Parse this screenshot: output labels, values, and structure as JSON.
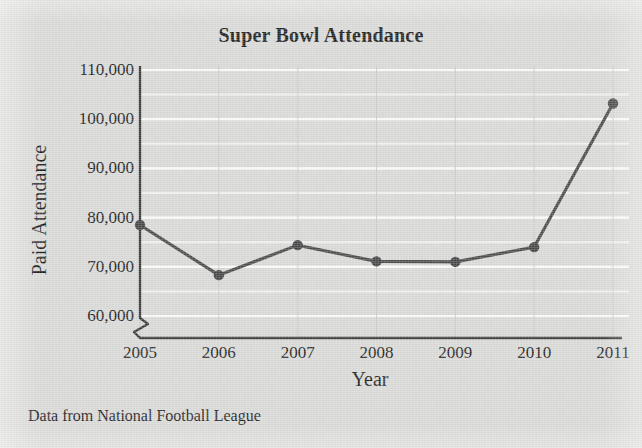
{
  "chart_data": {
    "type": "line",
    "title": "Super Bowl Attendance",
    "xlabel": "Year",
    "ylabel": "Paid Attendance",
    "categories": [
      "2005",
      "2006",
      "2007",
      "2008",
      "2009",
      "2010",
      "2011"
    ],
    "x": [
      2005,
      2006,
      2007,
      2008,
      2009,
      2010,
      2011
    ],
    "values": [
      78500,
      68300,
      74400,
      71100,
      71000,
      74000,
      103200
    ],
    "series": [
      {
        "name": "Paid Attendance",
        "values": [
          78500,
          68300,
          74400,
          71100,
          71000,
          74000,
          103200
        ]
      }
    ],
    "ylim": [
      60000,
      110000
    ],
    "xlim": [
      2005,
      2011
    ],
    "y_tick_labels": [
      "110,000",
      "100,000",
      "90,000",
      "80,000",
      "70,000",
      "60,000"
    ],
    "y_tick_values": [
      110000,
      100000,
      90000,
      80000,
      70000,
      60000
    ],
    "y_minor_step": 5000,
    "x_tick_labels": [
      "2005",
      "2006",
      "2007",
      "2008",
      "2009",
      "2010",
      "2011"
    ],
    "grid": "horizontal-major-and-minor-white, vertical-at-each-year",
    "legend": "none",
    "axis_break": "y-axis broken below 60,000",
    "marker": "filled-circle",
    "annotations": [
      "Data from National Football League"
    ]
  },
  "chart": {
    "title": "Super Bowl Attendance",
    "y_axis_title": "Paid Attendance",
    "x_axis_title": "Year",
    "source_note": "Data from National Football League"
  },
  "colors": {
    "background": "#d9d9d7",
    "line": "#4a4a4a",
    "marker": "#444444",
    "axis": "#3a3a3a",
    "gridline": "#f2f2f0",
    "vertical_gridline": "#c9c9c6",
    "text": "#1a1a1a"
  }
}
